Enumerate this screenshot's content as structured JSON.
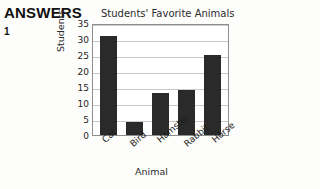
{
  "answers": {
    "heading": "ANSWERS",
    "number": "1"
  },
  "chart_data": {
    "type": "bar",
    "title": "Students' Favorite Animals",
    "xlabel": "Animal",
    "ylabel": "Students",
    "categories": [
      "Cat",
      "Bird",
      "Hamster",
      "Rabbit",
      "Horse"
    ],
    "values": [
      31,
      4,
      13,
      14,
      25
    ],
    "ylim": [
      0,
      35
    ],
    "yticks": [
      0,
      5,
      10,
      15,
      20,
      25,
      30,
      35
    ],
    "grid": true,
    "legend": null,
    "bar_color": "#2a2a2a",
    "grid_color": "#c9c9c9",
    "frame_color": "#8e8e8e"
  }
}
